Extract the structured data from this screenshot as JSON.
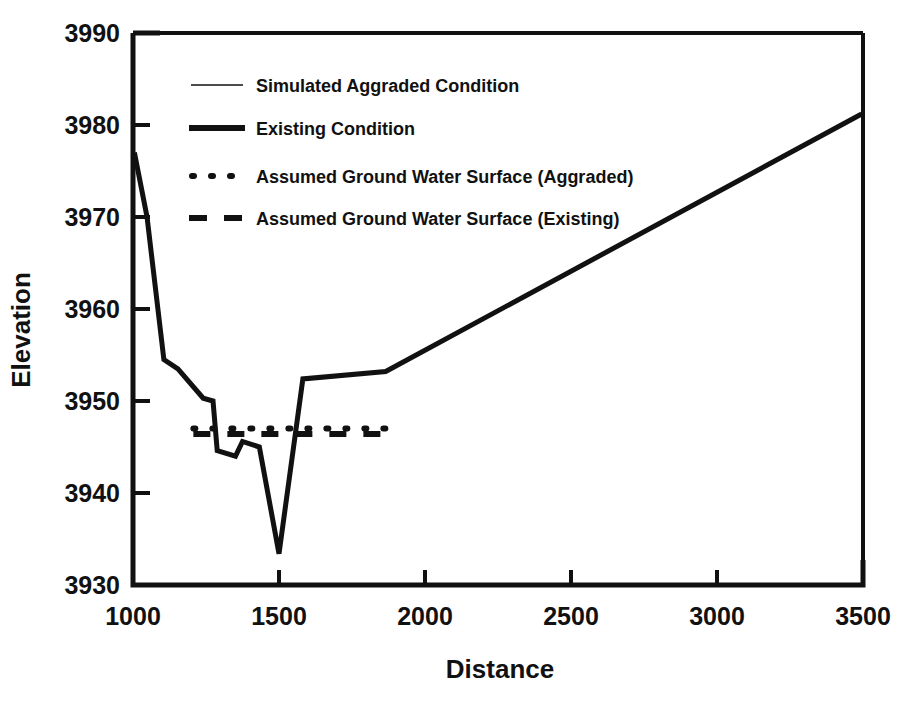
{
  "chart_data": {
    "type": "line",
    "title": "",
    "subtitle": "",
    "xlabel": "Distance",
    "ylabel": "Elevation",
    "xlim": [
      900,
      3500
    ],
    "ylim": [
      3930,
      3990
    ],
    "xticks": [
      1000,
      1500,
      2000,
      2500,
      3000,
      3500
    ],
    "yticks": [
      3930,
      3940,
      3950,
      3960,
      3970,
      3980,
      3990
    ],
    "xtick_labels": [
      "1000",
      "1500",
      "2000",
      "2500",
      "3000",
      "3500"
    ],
    "ytick_labels": [
      "3930",
      "3940",
      "3950",
      "3960",
      "3970",
      "3980",
      "3990"
    ],
    "grid": false,
    "legend_position": "upper-left-inside",
    "series": [
      {
        "name": "Simulated Aggraded Condition",
        "style": "thin-solid",
        "color": "#111111",
        "points": []
      },
      {
        "name": "Existing Condition",
        "style": "thick-solid",
        "color": "#111111",
        "points": [
          [
            905,
            3977.0
          ],
          [
            950,
            3970.0
          ],
          [
            1010,
            3954.5
          ],
          [
            1060,
            3953.5
          ],
          [
            1150,
            3950.3
          ],
          [
            1185,
            3950.0
          ],
          [
            1200,
            3944.6
          ],
          [
            1265,
            3944.0
          ],
          [
            1290,
            3945.6
          ],
          [
            1350,
            3945.0
          ],
          [
            1420,
            3933.4
          ],
          [
            1505,
            3952.4
          ],
          [
            1800,
            3953.2
          ],
          [
            3495,
            3981.2
          ]
        ]
      },
      {
        "name": "Assumed Ground Water Surface (Aggraded)",
        "style": "dotted",
        "color": "#111111",
        "points": [
          [
            1115,
            3947.0
          ],
          [
            1800,
            3947.0
          ]
        ]
      },
      {
        "name": "Assumed Ground Water Surface (Existing)",
        "style": "dashed",
        "color": "#111111",
        "points": [
          [
            1115,
            3946.4
          ],
          [
            1800,
            3946.4
          ]
        ]
      }
    ],
    "legend_entries": [
      {
        "label": "Simulated Aggraded Condition",
        "style": "thin-solid"
      },
      {
        "label": "Existing Condition",
        "style": "thick-solid"
      },
      {
        "label": "Assumed Ground Water Surface (Aggraded)",
        "style": "dotted"
      },
      {
        "label": "Assumed Ground Water Surface (Existing)",
        "style": "dashed"
      }
    ]
  },
  "axes": {
    "x_title": "Distance",
    "y_title": "Elevation",
    "x_labels": [
      "1000",
      "1500",
      "2000",
      "2500",
      "3000",
      "3500"
    ],
    "y_labels": [
      "3990",
      "3980",
      "3970",
      "3960",
      "3950",
      "3940",
      "3930"
    ]
  },
  "legend": {
    "entry_0": "Simulated Aggraded Condition",
    "entry_1": "Existing Condition",
    "entry_2": "Assumed Ground Water Surface (Aggraded)",
    "entry_3": "Assumed Ground Water Surface (Existing)"
  },
  "colors": {
    "ink": "#111111",
    "background": "#ffffff"
  }
}
